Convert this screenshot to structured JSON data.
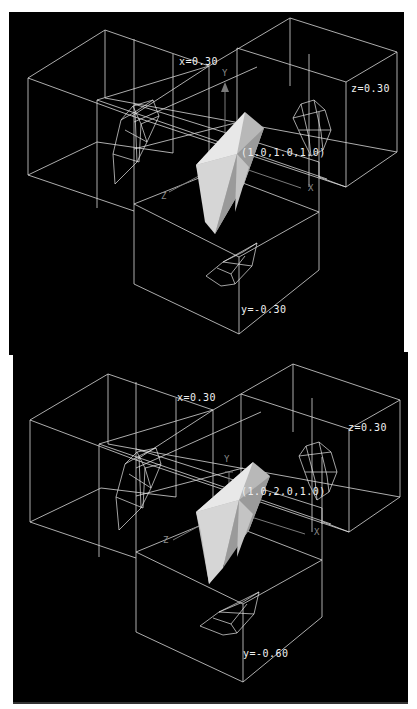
{
  "figure": {
    "panels": [
      {
        "id": "top",
        "slice_labels": {
          "x": "x=0.30",
          "z": "z=0.30",
          "y": "y=-0.30"
        },
        "point_label": "(1.0,1.0,1.0)",
        "axes": {
          "x": "X",
          "y": "Y",
          "z": "Z"
        }
      },
      {
        "id": "bottom",
        "slice_labels": {
          "x": "x=0.30",
          "z": "z=0.30",
          "y": "y=-0.60"
        },
        "point_label": "(1.0,2.0,1.0)",
        "axes": {
          "x": "X",
          "y": "Y",
          "z": "Z"
        }
      }
    ],
    "colors": {
      "background": "#000000",
      "wireframe": "#d8d8d8",
      "solid_light": "#e8e8e8",
      "solid_mid": "#b8b8b8",
      "solid_dark": "#8c8c8c",
      "axis": "#7a7a7a"
    }
  }
}
